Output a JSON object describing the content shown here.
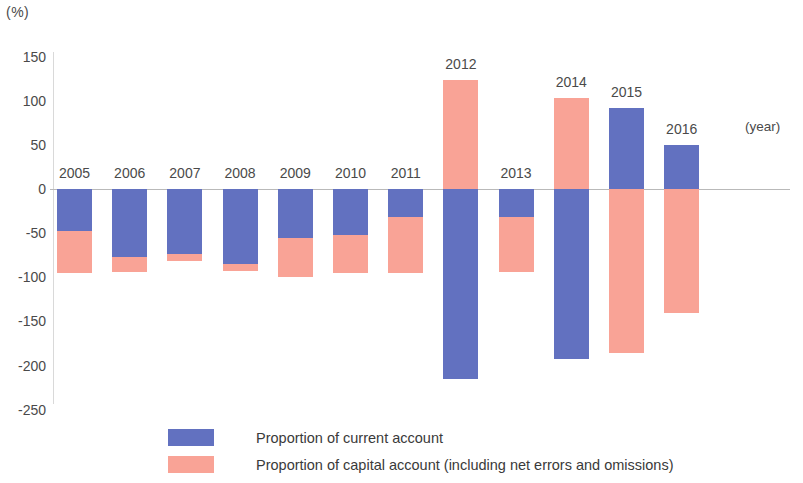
{
  "axis": {
    "unit_label": "(%)",
    "year_caption": "(year)",
    "y_ticks": [
      "150",
      "100",
      "50",
      "0",
      "-50",
      "-100",
      "-150",
      "-200",
      "-250"
    ]
  },
  "legend": {
    "items": [
      {
        "key": "current",
        "label": "Proportion of current account",
        "color": "#6271c0"
      },
      {
        "key": "capital",
        "label": "Proportion of capital account (including net errors and omissions)",
        "color": "#f9a396"
      }
    ]
  },
  "chart_data": {
    "type": "bar",
    "title": "",
    "subtitle": "",
    "xlabel": "(year)",
    "ylabel": "(%)",
    "ylim": [
      -250,
      150
    ],
    "ytick_step": 50,
    "grid": false,
    "stacked": true,
    "legend_position": "bottom",
    "categories": [
      "2005",
      "2006",
      "2007",
      "2008",
      "2009",
      "2010",
      "2011",
      "2012",
      "2013",
      "2014",
      "2015",
      "2016"
    ],
    "series": [
      {
        "name": "Proportion of current account",
        "color": "#6271c0",
        "values": [
          -47,
          -77,
          -74,
          -85,
          -56,
          -52,
          -32,
          -215,
          -32,
          -193,
          92,
          50
        ]
      },
      {
        "name": "Proportion of capital account (including net errors and omissions)",
        "color": "#f9a396",
        "values": [
          -48,
          -17,
          -8,
          -8,
          -44,
          -43,
          -63,
          124,
          -62,
          103,
          -186,
          -140
        ]
      }
    ],
    "totals": [
      -95,
      -94,
      -82,
      -93,
      -100,
      -95,
      -95,
      -91,
      -94,
      -90,
      -94,
      -90
    ]
  }
}
